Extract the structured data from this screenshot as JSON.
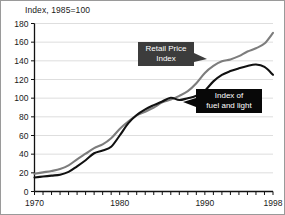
{
  "chart_data": {
    "type": "line",
    "title": "Index, 1985=100",
    "xlabel": "",
    "ylabel": "Index, 1985=100",
    "xlim": [
      1970,
      1998
    ],
    "ylim": [
      0,
      180
    ],
    "ytick_labels": [
      "180",
      "160",
      "140",
      "120",
      "100",
      "80",
      "60",
      "40",
      "20",
      "0"
    ],
    "ytick_values": [
      180,
      160,
      140,
      120,
      100,
      80,
      60,
      40,
      20,
      0
    ],
    "xtick_labels": [
      "1970",
      "1980",
      "1990",
      "1998"
    ],
    "xtick_values": [
      1970,
      1980,
      1990,
      1998
    ],
    "grid": "horizontal",
    "legend_position": "inline-callouts",
    "x": [
      1970,
      1971,
      1972,
      1973,
      1974,
      1975,
      1976,
      1977,
      1978,
      1979,
      1980,
      1981,
      1982,
      1983,
      1984,
      1985,
      1986,
      1987,
      1988,
      1989,
      1990,
      1991,
      1992,
      1993,
      1994,
      1995,
      1996,
      1997,
      1998
    ],
    "series": [
      {
        "name": "Retail Price Index",
        "color": "#7d7d7d",
        "values": [
          19,
          20.5,
          22,
          24,
          28,
          34.5,
          40.5,
          46.5,
          50.5,
          57,
          67,
          75,
          81.5,
          85.5,
          90,
          95.5,
          98.5,
          102.5,
          107.5,
          116,
          127,
          134.5,
          139.5,
          141.5,
          145,
          150,
          153.5,
          158.5,
          170
        ]
      },
      {
        "name": "Index of fuel and light",
        "color": "#111111",
        "values": [
          15,
          16,
          17,
          18,
          21,
          27,
          33.5,
          41,
          44,
          48,
          60,
          73,
          82,
          88,
          92.5,
          96.5,
          100.5,
          98,
          100,
          102.5,
          108,
          118,
          125,
          129,
          132,
          134.5,
          136,
          133.5,
          125
        ]
      }
    ],
    "annotations": [
      {
        "id": "callout-rpi",
        "label": "Retail Price Index",
        "lines": [
          "Retail Price",
          "Index"
        ],
        "background": "#3c3c3c",
        "text_color": "#ffffff",
        "points_to_series": "Retail Price Index"
      },
      {
        "id": "callout-fuel",
        "label": "Index of fuel and light",
        "lines": [
          "Index of",
          "fuel and light"
        ],
        "background": "#080808",
        "text_color": "#ffffff",
        "points_to_series": "Index of fuel and light"
      }
    ]
  },
  "figure": {
    "axis_title": "Index, 1985=100",
    "background": "#ffffff",
    "border_color": "#9a9a9a",
    "gridline_color": "#c8c8c8",
    "axis_color": "#111111"
  }
}
